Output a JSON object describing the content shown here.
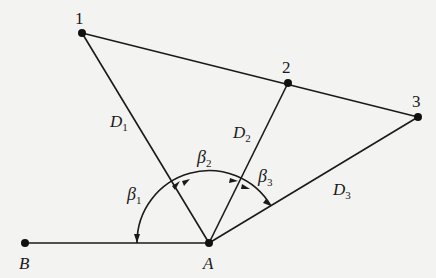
{
  "diagram": {
    "points": {
      "p1": {
        "label": "1",
        "x": 82,
        "y": 33
      },
      "p2": {
        "label": "2",
        "x": 288,
        "y": 83
      },
      "p3": {
        "label": "3",
        "x": 418,
        "y": 117
      },
      "A": {
        "label": "A",
        "x": 209,
        "y": 243
      },
      "B": {
        "label": "B",
        "x": 25,
        "y": 243
      }
    },
    "distances": {
      "D1": {
        "main": "D",
        "sub": "1"
      },
      "D2": {
        "main": "D",
        "sub": "2"
      },
      "D3": {
        "main": "D",
        "sub": "3"
      }
    },
    "angles": {
      "beta1": {
        "main": "β",
        "sub": "1"
      },
      "beta2": {
        "main": "β",
        "sub": "2"
      },
      "beta3": {
        "main": "β",
        "sub": "3"
      }
    },
    "line_color": "#1a1a1a"
  }
}
